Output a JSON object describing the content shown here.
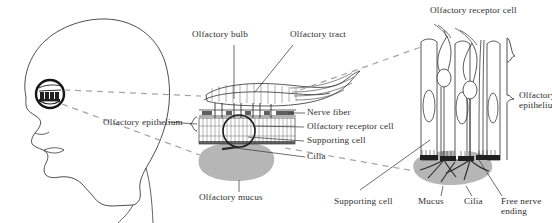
{
  "figure": {
    "title_alt": "Olfactory system: head profile, olfactory bulb region, and olfactory epithelium cellular detail",
    "background_color": "#ffffff",
    "ink_color": "#2b2b2b",
    "mucus_gray": "#a9a9a9",
    "dash_gray": "#a3a3ab",
    "panels": [
      {
        "name": "head-profile-panel",
        "caption": "Lateral view of human head with olfactory region marked"
      },
      {
        "name": "olfactory-bulb-panel",
        "caption": "Magnified sagittal view of olfactory bulb and epithelium"
      },
      {
        "name": "epithelium-cells-panel",
        "caption": "Magnified olfactory epithelium cells"
      }
    ]
  },
  "labels": {
    "head_epithelium": "Olfactory epithelium",
    "olfactory_bulb": "Olfactory bulb",
    "olfactory_tract": "Olfactory tract",
    "nerve_fiber": "Nerve fiber",
    "olfactory_receptor_cell_mid": "Olfactory receptor cell",
    "supporting_cell_mid": "Supporting cell",
    "cilia_mid": "Cilia",
    "olfactory_mucus": "Olfactory mucus",
    "olfactory_receptor_cell_top": "Olfactory receptor cell",
    "olfactory_epithelium_right": "Olfactory epithelium",
    "supporting_cell_bottom": "Supporting cell",
    "mucus_bottom": "Mucus",
    "cilia_bottom": "Cilia",
    "free_nerve_ending": "Free nerve ending"
  }
}
